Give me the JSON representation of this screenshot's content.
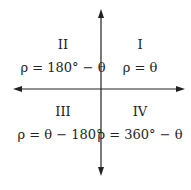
{
  "diagram": {
    "type": "quadrant-axes",
    "quadrants": [
      {
        "id": "I",
        "label": "I",
        "formula": "ρ = θ"
      },
      {
        "id": "II",
        "label": "II",
        "formula": "ρ = 180° − θ"
      },
      {
        "id": "III",
        "label": "III",
        "formula": "ρ = θ − 180°"
      },
      {
        "id": "IV",
        "label": "IV",
        "formula": "ρ = 360° − θ"
      }
    ],
    "colors": {
      "axis": "#222222",
      "text": "#222222",
      "background": "#ffffff"
    }
  }
}
